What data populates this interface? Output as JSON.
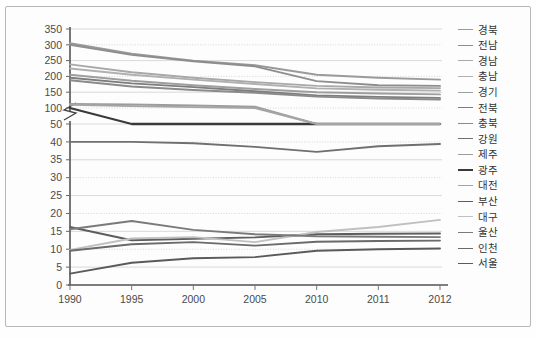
{
  "chart_data": {
    "type": "line",
    "title": "",
    "xlabel": "",
    "ylabel": "",
    "grid": true,
    "legend_position": "right",
    "axis_break": true,
    "axis_break_note": "y-axis broken between 50 and 100",
    "x": [
      "1990",
      "1995",
      "2000",
      "2005",
      "2010",
      "2011",
      "2012"
    ],
    "x_tick_labels": [
      "1990",
      "1995",
      "2000",
      "2005",
      "2010",
      "2011",
      "2012"
    ],
    "y_tick_labels": [
      "350",
      "300",
      "250",
      "200",
      "150",
      "100",
      "50",
      "40",
      "35",
      "30",
      "25",
      "20",
      "15",
      "10",
      "5",
      "0"
    ],
    "y_upper_ticks": [
      350,
      300,
      250,
      200,
      150,
      100
    ],
    "y_lower_ticks": [
      50,
      40,
      35,
      30,
      25,
      20,
      15,
      10,
      5,
      0
    ],
    "ylim_upper": [
      100,
      350
    ],
    "ylim_lower": [
      0,
      50
    ],
    "series": [
      {
        "name": "경북",
        "color": "#9a9a9a",
        "width": 1.9,
        "values": [
          305,
          272,
          250,
          235,
          205,
          196,
          190
        ]
      },
      {
        "name": "전남",
        "color": "#8d8d8d",
        "width": 1.9,
        "values": [
          300,
          268,
          248,
          232,
          185,
          172,
          170
        ]
      },
      {
        "name": "경남",
        "color": "#a8a8a8",
        "width": 1.9,
        "values": [
          238,
          213,
          196,
          182,
          170,
          165,
          163
        ]
      },
      {
        "name": "충남",
        "color": "#b0b0b0",
        "width": 1.9,
        "values": [
          225,
          205,
          190,
          176,
          162,
          158,
          155
        ]
      },
      {
        "name": "경기",
        "color": "#9e9e9e",
        "width": 1.9,
        "values": [
          205,
          186,
          172,
          160,
          150,
          146,
          143
        ]
      },
      {
        "name": "전북",
        "color": "#7d7d7d",
        "width": 1.9,
        "values": [
          196,
          178,
          166,
          153,
          140,
          135,
          132
        ]
      },
      {
        "name": "충북",
        "color": "#8a8a8a",
        "width": 1.9,
        "values": [
          188,
          168,
          157,
          148,
          136,
          130,
          127
        ]
      },
      {
        "name": "강원",
        "color": "#6f6f6f",
        "width": 1.9,
        "values": [
          40,
          40,
          39.6,
          38.6,
          37.2,
          38.8,
          39.4
        ]
      },
      {
        "name": "제주",
        "color": "#9c9c9c",
        "width": 1.9,
        "values": [
          113,
          111,
          108,
          104,
          99,
          97,
          96
        ]
      },
      {
        "name": "광주",
        "color": "#3a3a3a",
        "width": 2.3,
        "values": [
          100,
          97,
          95,
          93,
          90,
          89,
          88
        ]
      },
      {
        "name": "대전",
        "color": "#a5a5a5",
        "width": 1.9,
        "values": [
          110,
          106,
          103,
          100,
          96,
          94,
          93
        ]
      },
      {
        "name": "부산",
        "color": "#5d5d5d",
        "width": 1.9,
        "values": [
          16.2,
          12.5,
          12.9,
          13.3,
          14.2,
          14.3,
          14.4
        ]
      },
      {
        "name": "대구",
        "color": "#c0c0c0",
        "width": 1.9,
        "values": [
          9.8,
          13.0,
          13.4,
          12.0,
          14.8,
          16.2,
          18.2
        ]
      },
      {
        "name": "울산",
        "color": "#7a7a7a",
        "width": 1.9,
        "values": [
          15.6,
          17.9,
          15.4,
          14.2,
          13.6,
          13.5,
          13.4
        ]
      },
      {
        "name": "인천",
        "color": "#6a6a6a",
        "width": 1.9,
        "values": [
          9.6,
          11.4,
          12.0,
          11.0,
          12.1,
          12.3,
          12.4
        ]
      },
      {
        "name": "서울",
        "color": "#5a5a5a",
        "width": 1.9,
        "values": [
          3.2,
          6.2,
          7.5,
          7.8,
          9.6,
          10.0,
          10.2
        ]
      }
    ]
  },
  "legend": {
    "items": [
      {
        "label": "경북"
      },
      {
        "label": "전남"
      },
      {
        "label": "경남"
      },
      {
        "label": "충남"
      },
      {
        "label": "경기"
      },
      {
        "label": "전북"
      },
      {
        "label": "충북"
      },
      {
        "label": "강원"
      },
      {
        "label": "제주"
      },
      {
        "label": "광주"
      },
      {
        "label": "대전"
      },
      {
        "label": "부산"
      },
      {
        "label": "대구"
      },
      {
        "label": "울산"
      },
      {
        "label": "인천"
      },
      {
        "label": "서울"
      }
    ]
  }
}
